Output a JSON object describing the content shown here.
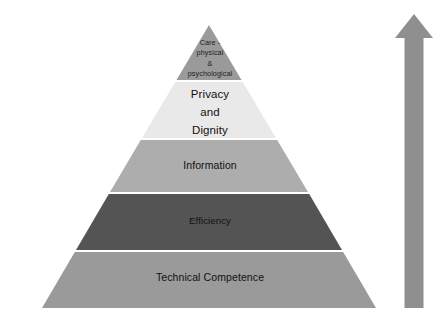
{
  "figure": {
    "type": "pyramid-diagram",
    "title_caption": "FIGURE 1",
    "background_color": "#ffffff",
    "tiers": [
      {
        "index": 1,
        "position": "apex",
        "label": "Care -\nphysical\n&\npsychological",
        "color": "#9a9a9a",
        "text_color": "#1c1c1c"
      },
      {
        "index": 2,
        "position": "upper",
        "label": "Privacy\nand\nDignity",
        "color": "#e9e9e9",
        "text_color": "#111111"
      },
      {
        "index": 3,
        "position": "middle",
        "label": "Information",
        "color": "#adadad",
        "text_color": "#111111"
      },
      {
        "index": 4,
        "position": "lower",
        "label": "Efficiency",
        "color": "#545454",
        "text_color": "#0a0a0a"
      },
      {
        "index": 5,
        "position": "base",
        "label": "Technical Competence",
        "color": "#9a9a9a",
        "text_color": "#111111"
      }
    ],
    "arrow": {
      "name": "upward-arrow",
      "direction": "up",
      "color": "#8f8f8f"
    },
    "caption": {
      "text": ""
    }
  }
}
